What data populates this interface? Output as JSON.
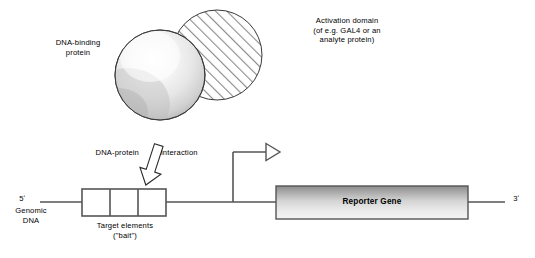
{
  "figure": {
    "background_color": "#ffffff",
    "width": 535,
    "height": 258
  },
  "labels": {
    "dna_binding_protein": "DNA-binding\nprotein",
    "activation_domain": "Activation domain\n(of e.g. GAL4 or an\nanalyte protein)",
    "dna_protein": "DNA-protein",
    "interaction": "interaction",
    "five_prime": "5ʹ",
    "genomic_dna": "Genomic\nDNA",
    "target_elements": "Target elements\n(\"bait\")",
    "reporter_gene": "Reporter Gene",
    "three_prime": "3ʹ"
  },
  "shapes": {
    "dna_binding_sphere": {
      "name": "DNA-binding protein",
      "cx": 160,
      "cy": 75,
      "r": 45,
      "fill_style": "radial-gradient-gray",
      "fill_light": "#ffffff",
      "fill_dark": "#9c9c9c",
      "stroke": "#3a3a3a"
    },
    "activation_domain_circle": {
      "name": "Activation domain",
      "cx": 217,
      "cy": 55,
      "r": 45,
      "fill_style": "diagonal-hatch",
      "hatch_color": "#808080",
      "stroke": "#3a3a3a"
    },
    "target_elements_box": {
      "name": "Target elements (bait)",
      "x": 82,
      "y": 189,
      "width": 84,
      "height": 27,
      "compartments": 3,
      "fill": "#ffffff",
      "stroke": "#555555"
    },
    "reporter_gene_box": {
      "name": "Reporter Gene",
      "x": 276,
      "y": 186,
      "width": 192,
      "height": 33,
      "fill_style": "vertical-gradient-gray",
      "fill_top": "#8e8e8e",
      "fill_bottom": "#f2f2f2",
      "stroke": "#555555"
    },
    "dna_backbone": {
      "name": "Genomic DNA line",
      "y": 202,
      "x_start": 40,
      "x_end": 505,
      "stroke": "#555555"
    },
    "transcription_start_arrow": {
      "name": "Transcription start arrow",
      "riser_x": 233,
      "riser_y_top": 152,
      "horizontal_x_end": 265,
      "arrowhead": "hollow-triangle-right",
      "stroke": "#555555"
    },
    "interaction_arrow": {
      "name": "DNA-protein interaction arrow",
      "direction": "down-left",
      "fill": "#ffffff",
      "stroke": "#2a2a2a"
    }
  },
  "colors": {
    "stroke": "#555555",
    "text": "#000000",
    "hatch": "#808080",
    "sphere_dark": "#9c9c9c",
    "reporter_top": "#8e8e8e",
    "reporter_bottom": "#f2f2f2"
  }
}
